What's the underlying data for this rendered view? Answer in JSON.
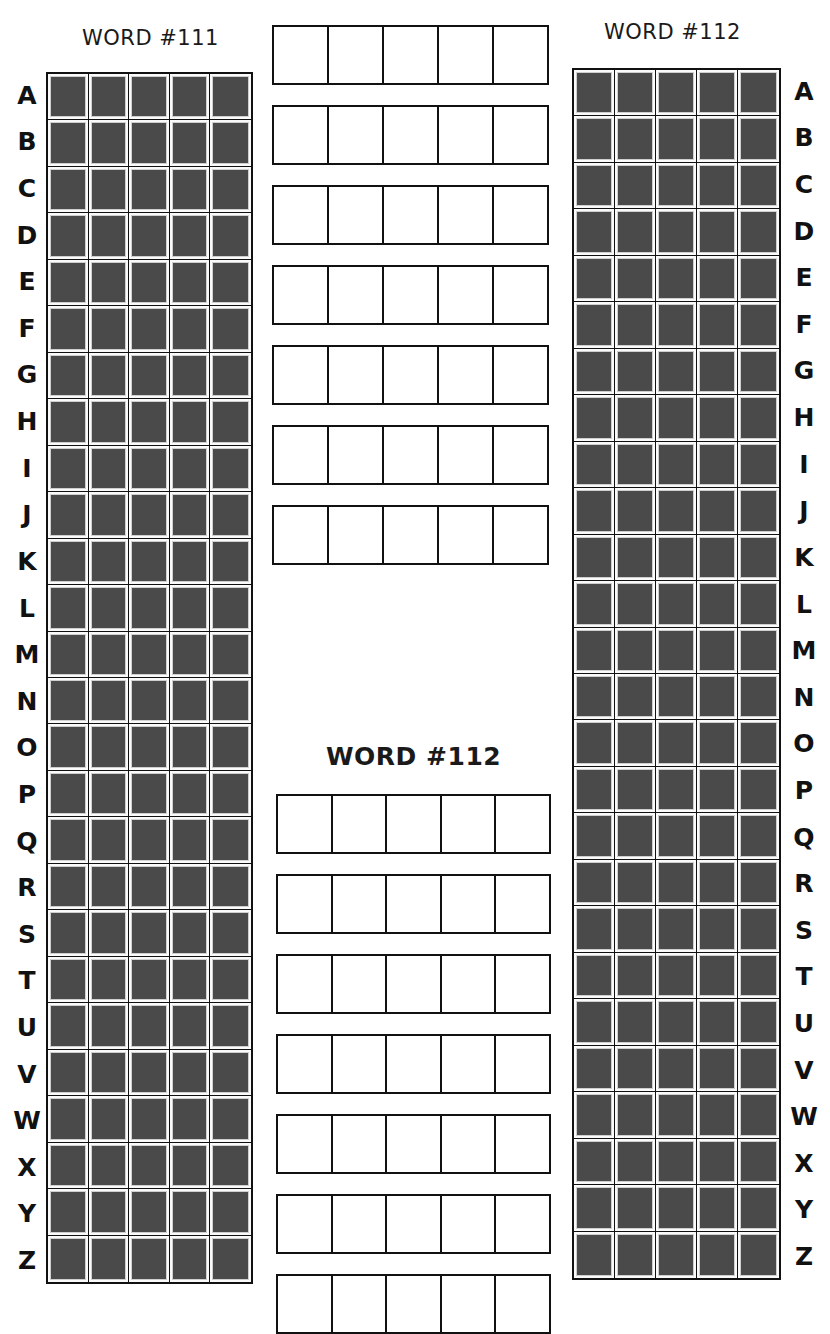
{
  "titles": {
    "left": "WORD #111",
    "right": "WORD #112",
    "center": "WORD #112"
  },
  "letters": [
    "A",
    "B",
    "C",
    "D",
    "E",
    "F",
    "G",
    "H",
    "I",
    "J",
    "K",
    "L",
    "M",
    "N",
    "O",
    "P",
    "Q",
    "R",
    "S",
    "T",
    "U",
    "V",
    "W",
    "X",
    "Y",
    "Z"
  ],
  "grid": {
    "columns": 5,
    "rows": 26,
    "cell_fill_color": "#4a4a4a",
    "border_color": "#111111"
  },
  "guess_sections": {
    "top": {
      "rows": 7,
      "boxes_per_row": 5,
      "x": 272,
      "y_start": 25,
      "width": 277,
      "spacing": 80
    },
    "bottom": {
      "rows": 7,
      "boxes_per_row": 5,
      "x": 276,
      "y_start": 794,
      "width": 275,
      "spacing": 80
    }
  }
}
